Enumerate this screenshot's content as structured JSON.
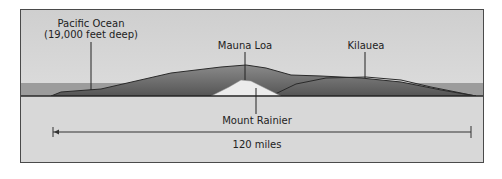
{
  "diagram": {
    "title": "",
    "labels": {
      "ocean_line1": "Pacific Ocean",
      "ocean_line2": "(19,000 feet deep)",
      "mauna_loa": "Mauna Loa",
      "kilauea": "Kilauea",
      "mount_rainier": "Mount Rainier",
      "scale": "120 miles"
    },
    "colors": {
      "sky": "#d4d4d4",
      "sea": "#9a9a9a",
      "mountain": "#6e6e6e",
      "ground": "#d8d8d8",
      "rainier": "#eeeeee",
      "outline": "#2a2a2a"
    }
  }
}
